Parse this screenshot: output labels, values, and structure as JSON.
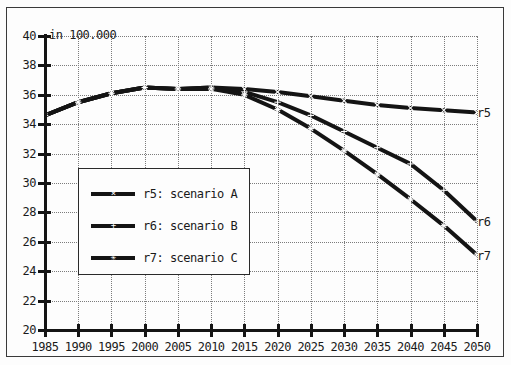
{
  "chart_data": {
    "type": "line",
    "title": "",
    "unit_label": "in 100.000",
    "xlabel": "",
    "ylabel": "",
    "xlim": [
      1985,
      2050
    ],
    "ylim": [
      20,
      40
    ],
    "grid": true,
    "legend_position": "center-left-inside",
    "xticks": [
      1985,
      1990,
      1995,
      2000,
      2005,
      2010,
      2015,
      2020,
      2025,
      2030,
      2035,
      2040,
      2045,
      2050
    ],
    "yticks": [
      20,
      22,
      24,
      26,
      28,
      30,
      32,
      34,
      36,
      38,
      40
    ],
    "x": [
      1985,
      1990,
      1995,
      2000,
      2005,
      2010,
      2015,
      2020,
      2025,
      2030,
      2035,
      2040,
      2045,
      2050
    ],
    "series": [
      {
        "name": "r5",
        "legend_label": "r5: scenario A",
        "end_label": "r5",
        "color": "#141414",
        "marker": "x",
        "values": [
          34.6,
          35.5,
          36.1,
          36.5,
          36.4,
          36.5,
          36.4,
          36.2,
          35.9,
          35.6,
          35.3,
          35.1,
          34.95,
          34.8
        ]
      },
      {
        "name": "r6",
        "legend_label": "r6: scenario B",
        "end_label": "r6",
        "color": "#141414",
        "marker": "plus",
        "values": [
          34.6,
          35.5,
          36.1,
          36.5,
          36.4,
          36.5,
          36.2,
          35.5,
          34.6,
          33.5,
          32.4,
          31.3,
          29.5,
          27.4
        ]
      },
      {
        "name": "r7",
        "legend_label": "r7: scenario C",
        "end_label": "r7",
        "color": "#141414",
        "marker": "star",
        "values": [
          34.6,
          35.5,
          36.1,
          36.5,
          36.4,
          36.4,
          36.0,
          35.0,
          33.7,
          32.2,
          30.6,
          28.9,
          27.1,
          25.1
        ]
      }
    ]
  },
  "axis": {
    "unit_caption": "in 100.000",
    "y_labels": [
      "40",
      "38",
      "36",
      "34",
      "32",
      "30",
      "28",
      "26",
      "24",
      "22",
      "20"
    ],
    "x_labels": [
      "1985",
      "1990",
      "1995",
      "2000",
      "2005",
      "2010",
      "2015",
      "2020",
      "2025",
      "2030",
      "2035",
      "2040",
      "2045",
      "2050"
    ]
  },
  "legend": {
    "entries": [
      {
        "label": "r5: scenario A"
      },
      {
        "label": "r6: scenario B"
      },
      {
        "label": "r7: scenario C"
      }
    ]
  },
  "end_labels": {
    "r5": "r5",
    "r6": "r6",
    "r7": "r7"
  }
}
